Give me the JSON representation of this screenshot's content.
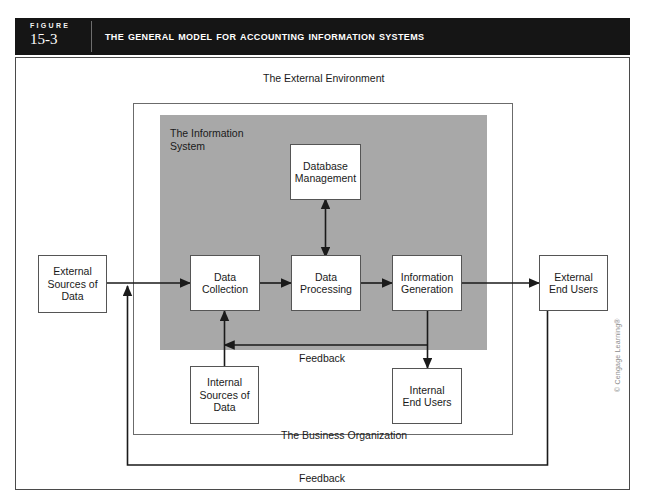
{
  "figure": {
    "label_word": "FIGURE",
    "number": "15-3",
    "title": "The General Model for Accounting Information Systems"
  },
  "diagram": {
    "type": "flow-diagram",
    "outer_label": "The External Environment",
    "business_label": "The Business Organization",
    "information_system_label": "The Information\nSystem",
    "information_system_label_line1": "The Information",
    "information_system_label_line2": "System",
    "feedback_inner_label": "Feedback",
    "feedback_outer_label": "Feedback",
    "boxes": [
      {
        "id": "external-sources-of-data",
        "label": "External\nSources of\nData",
        "lines": [
          "External",
          "Sources of",
          "Data"
        ]
      },
      {
        "id": "data-collection",
        "label": "Data\nCollection",
        "lines": [
          "Data",
          "Collection"
        ]
      },
      {
        "id": "data-processing",
        "label": "Data\nProcessing",
        "lines": [
          "Data",
          "Processing"
        ]
      },
      {
        "id": "information-generation",
        "label": "Information\nGeneration",
        "lines": [
          "Information",
          "Generation"
        ]
      },
      {
        "id": "database-management",
        "label": "Database\nManagement",
        "lines": [
          "Database",
          "Management"
        ]
      },
      {
        "id": "external-end-users",
        "label": "External\nEnd Users",
        "lines": [
          "External",
          "End Users"
        ]
      },
      {
        "id": "internal-sources-of-data",
        "label": "Internal\nSources of\nData",
        "lines": [
          "Internal",
          "Sources of",
          "Data"
        ]
      },
      {
        "id": "internal-end-users",
        "label": "Internal\nEnd Users",
        "lines": [
          "Internal",
          "End Users"
        ]
      }
    ],
    "flows": [
      {
        "from": "external-sources-of-data",
        "to": "data-collection",
        "style": "arrow"
      },
      {
        "from": "data-collection",
        "to": "data-processing",
        "style": "arrow"
      },
      {
        "from": "data-processing",
        "to": "information-generation",
        "style": "arrow"
      },
      {
        "from": "information-generation",
        "to": "external-end-users",
        "style": "arrow"
      },
      {
        "from": "database-management",
        "to": "data-processing",
        "style": "double-arrow"
      },
      {
        "from": "internal-sources-of-data",
        "to": "data-collection",
        "style": "arrow"
      },
      {
        "from": "information-generation",
        "to": "internal-end-users",
        "style": "arrow"
      },
      {
        "from": "information-generation",
        "to": "data-collection",
        "style": "feedback-arrow",
        "label": "Feedback"
      },
      {
        "from": "external-end-users",
        "to": "external-sources-of-data",
        "style": "feedback-arrow",
        "label": "Feedback"
      }
    ]
  },
  "colors": {
    "header_bg": "#151515",
    "header_text": "#ffffff",
    "information_system_fill": "#a8a8a8",
    "box_fill": "#ffffff",
    "box_stroke": "#555555",
    "line": "#1a1a1a",
    "frame": "#4a4a4a",
    "page_bg": "#ffffff"
  },
  "credit": {
    "text": "© Cengage Learning®"
  }
}
